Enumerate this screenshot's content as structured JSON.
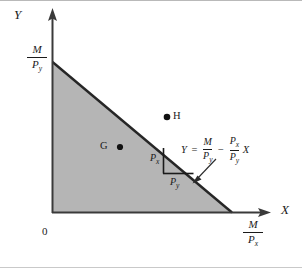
{
  "figure": {
    "type": "budget-constraint-diagram",
    "background_color": "#ffffff",
    "shade_color": "#b3b3b3",
    "line_color": "#1a1a1a",
    "axes": {
      "y_label": "Y",
      "x_label": "X",
      "origin_label": "0"
    },
    "intercepts": {
      "vertical": {
        "numerator": "M",
        "denominator": "P",
        "den_sub": "y"
      },
      "horizontal": {
        "numerator": "M",
        "denominator": "P",
        "den_sub": "x"
      }
    },
    "slope_triangle": {
      "vertical_leg": {
        "base": "P",
        "sub": "x"
      },
      "horizontal_leg": {
        "base": "P",
        "sub": "y"
      }
    },
    "equation": {
      "lhs": "Y",
      "equals": "=",
      "term1": {
        "num": "M",
        "den": "P",
        "den_sub": "y"
      },
      "minus": "−",
      "term2": {
        "num": "P",
        "num_sub": "x",
        "den": "P",
        "den_sub": "y"
      },
      "variable": "X"
    },
    "points": [
      {
        "id": "G",
        "label": "G",
        "position": "inside-feasible-region"
      },
      {
        "id": "H",
        "label": "H",
        "position": "outside-feasible-region"
      }
    ]
  }
}
